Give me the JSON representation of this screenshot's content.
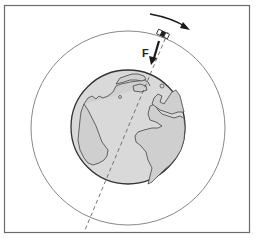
{
  "diagram": {
    "force_label": "F",
    "orbit_direction": "clockwise",
    "colors": {
      "frame": "#6b6b6b",
      "orbit": "#7a7a7a",
      "earth_fill": "#d9d9d9",
      "earth_outline": "#333333",
      "arrow": "#1a1a1a"
    }
  }
}
